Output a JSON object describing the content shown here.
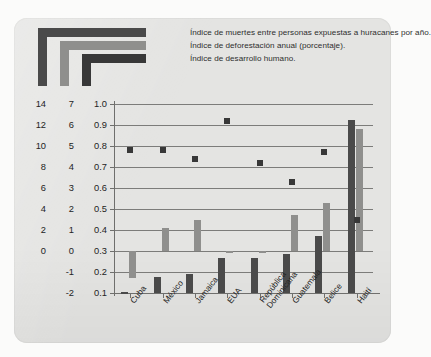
{
  "legend": {
    "items": [
      {
        "label": "Índice de muertes entre personas expuestas a huracanes por año.",
        "color": "#4a4a4a",
        "swatch": "elbow-outer"
      },
      {
        "label": "Índice de deforestación anual (porcentaje).",
        "color": "#8f8f8d",
        "swatch": "elbow-middle"
      },
      {
        "label": "Índice de desarrollo humano.",
        "color": "#383838",
        "swatch": "elbow-inner"
      }
    ]
  },
  "axes": {
    "deaths_ticks": [
      "14",
      "12",
      "10",
      "8",
      "6",
      "4",
      "2",
      "0"
    ],
    "deforestation_ticks": [
      "7",
      "6",
      "5",
      "4",
      "3",
      "2",
      "1",
      "0",
      "-1",
      "-2"
    ],
    "hdi_ticks": [
      "1.0",
      "0.9",
      "0.8",
      "0.7",
      "0.6",
      "0.5",
      "0.4",
      "0.3",
      "0.2",
      "0.1"
    ]
  },
  "chart_data": {
    "type": "bar",
    "title": "",
    "xlabel": "",
    "ylabel": "",
    "grid": true,
    "legend_position": "top",
    "categories": [
      "Cuba",
      "México",
      "Jamaica",
      "EUA",
      "República Dominicana",
      "Guatemala",
      "Belice",
      "Haití"
    ],
    "series": [
      {
        "name": "Índice de muertes entre personas expuestas a huracanes por año.",
        "type": "bar",
        "axis": "deaths",
        "color": "#4a4a4a",
        "ylim": [
          0,
          14
        ],
        "values": [
          0.1,
          1.2,
          1.4,
          2.6,
          2.6,
          2.9,
          4.2,
          12.8
        ]
      },
      {
        "name": "Índice de deforestación anual (porcentaje).",
        "type": "bar",
        "axis": "deforestation",
        "color": "#8f8f8d",
        "ylim": [
          -2,
          7
        ],
        "values": [
          -1.3,
          1.1,
          1.5,
          -0.1,
          0.0,
          1.7,
          2.3,
          5.8
        ]
      },
      {
        "name": "Índice de desarrollo humano.",
        "type": "scatter",
        "axis": "hdi",
        "color": "#383838",
        "ylim": [
          0.1,
          1.0
        ],
        "values": [
          0.78,
          0.78,
          0.74,
          0.92,
          0.72,
          0.63,
          0.77,
          0.45
        ]
      }
    ]
  }
}
